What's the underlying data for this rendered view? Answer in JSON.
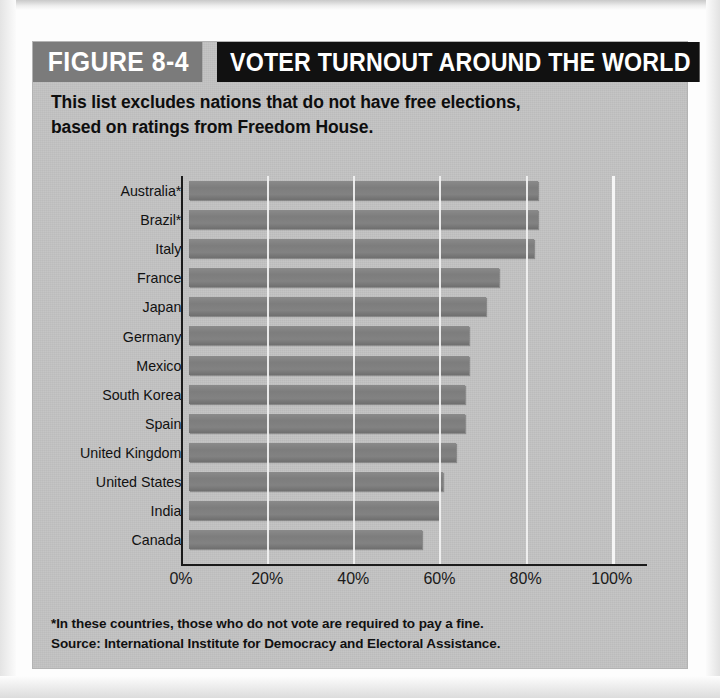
{
  "figure": {
    "number_label": "FIGURE 8-4",
    "title": "VOTER TURNOUT AROUND THE WORLD",
    "subtitle": "This list excludes nations that do not have free elections, based on ratings from Freedom House.",
    "footnote": "*In these countries, those who do not vote are required to pay a fine.",
    "source": "Source: International Institute for Democracy and  Electoral Assistance."
  },
  "colors": {
    "card_background": "#c3c3c3",
    "title_bar": "#111111",
    "figure_number_bar": "#7b7b7b",
    "bar_fill": "#7d7d7d",
    "axis": "#1b1b1b",
    "gridline": "#f2f2f2"
  },
  "chart_data": {
    "type": "bar",
    "orientation": "horizontal",
    "title": "VOTER TURNOUT AROUND THE WORLD",
    "subtitle": "This list excludes nations that do not have free elections, based on ratings from Freedom House.",
    "xlabel": "",
    "ylabel": "",
    "xlim": [
      0,
      100
    ],
    "xtick_labels": [
      "0%",
      "20%",
      "40%",
      "60%",
      "80%",
      "100%"
    ],
    "xticks": [
      0,
      20,
      40,
      60,
      80,
      100
    ],
    "grid": true,
    "legend": "none",
    "categories": [
      "Australia*",
      "Brazil*",
      "Italy",
      "France",
      "Japan",
      "Germany",
      "Mexico",
      "South Korea",
      "Spain",
      "United Kingdom",
      "United States",
      "India",
      "Canada"
    ],
    "values": [
      81,
      81,
      80,
      72,
      69,
      65,
      65,
      64,
      64,
      62,
      59,
      58,
      54
    ],
    "annotations": [
      "*In these countries, those who do not vote are required to pay a fine.",
      "Source: International Institute for Democracy and  Electoral Assistance."
    ]
  }
}
